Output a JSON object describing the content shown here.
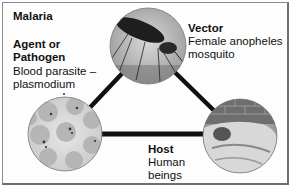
{
  "diagram": {
    "title": "Malaria",
    "nodes": [
      {
        "id": "agent",
        "heading_line1": "Agent or",
        "heading_line2": "Pathogen",
        "desc_line1": "Blood parasite –",
        "desc_line2": "plasmodium",
        "image": "blood-cells-micrograph"
      },
      {
        "id": "vector",
        "heading": "Vector",
        "desc_line1": "Female anopheles",
        "desc_line2": "mosquito",
        "image": "mosquito-photo"
      },
      {
        "id": "host",
        "heading": "Host",
        "desc_line1": "Human",
        "desc_line2": "beings",
        "image": "sleeping-person-photo"
      }
    ],
    "edges": [
      [
        "agent",
        "vector"
      ],
      [
        "vector",
        "host"
      ],
      [
        "agent",
        "host"
      ]
    ],
    "colors": {
      "edge": "#111111",
      "frame": "#8a8a8a"
    }
  }
}
